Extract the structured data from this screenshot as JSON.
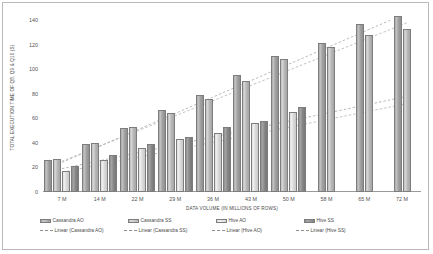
{
  "chart_data": {
    "type": "bar",
    "title": "",
    "subtitle": "",
    "xlabel": "DATA VOLUME (IN MILLIONS OF ROWS)",
    "ylabel": "TOTAL EXECUTION TIME OF Q8, Q9 & Q10 (S)",
    "categories": [
      "7 M",
      "14 M",
      "22 M",
      "29 M",
      "36 M",
      "43 M",
      "50 M",
      "58 M",
      "65 M",
      "72 M"
    ],
    "ylim": [
      0,
      140
    ],
    "yticks": [
      0,
      20,
      40,
      60,
      80,
      100,
      120,
      140
    ],
    "ytick_labels": [
      "0",
      "20",
      "40",
      "60",
      "80",
      "100",
      "120",
      "140"
    ],
    "grid": false,
    "legend_position": "bottom",
    "series": [
      {
        "name": "Cassandra AO",
        "color": "#a8a8a8",
        "values": [
          26,
          39,
          52,
          67,
          79,
          95,
          111,
          121,
          137,
          143
        ]
      },
      {
        "name": "Cassandra SS",
        "color": "#bdbdbd",
        "values": [
          27,
          40,
          53,
          64,
          76,
          90,
          108,
          118,
          128,
          133
        ]
      },
      {
        "name": "Hive AO",
        "color": "#dedede",
        "values": [
          17,
          26,
          36,
          43,
          48,
          56,
          65,
          null,
          null,
          null
        ]
      },
      {
        "name": "Hive SS",
        "color": "#8c8c8c",
        "values": [
          21,
          30,
          39,
          45,
          53,
          58,
          69,
          null,
          null,
          null
        ]
      }
    ],
    "trendlines": [
      {
        "name": "Linear (Cassandra AO)",
        "style": "dashed",
        "color": "#9c9c9c",
        "y_start": 24,
        "y_end": 146
      },
      {
        "name": "Linear (Cassandra SS)",
        "style": "dashed",
        "color": "#a6a6a6",
        "y_start": 25,
        "y_end": 138
      },
      {
        "name": "Linear (Hive AO)",
        "style": "dashed",
        "color": "#a8a8a8",
        "y_start": 16,
        "y_end": 72
      },
      {
        "name": "Linear (Hive SS)",
        "style": "dashed",
        "color": "#9a9a9a",
        "y_start": 19,
        "y_end": 78
      }
    ]
  },
  "legend": {
    "row1": [
      {
        "label": "Cassandra AO",
        "swatch": "s0"
      },
      {
        "label": "Cassandra SS",
        "swatch": "s1"
      },
      {
        "label": "Hive AO",
        "swatch": "s2"
      },
      {
        "label": "Hive SS",
        "swatch": "s3"
      }
    ],
    "row2": [
      {
        "label": "Linear (Cassandra AO)"
      },
      {
        "label": "Linear (Cassandra SS)"
      },
      {
        "label": "Linear (Hive AO)"
      },
      {
        "label": "Linear (Hive SS)"
      }
    ]
  }
}
